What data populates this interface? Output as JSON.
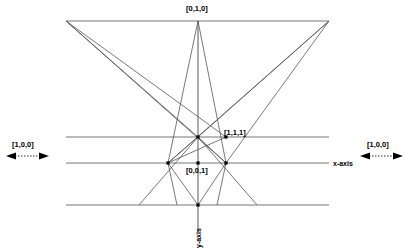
{
  "figure": {
    "background_color": "#ffffff",
    "line_color": "#555555",
    "vertex_color": "#000000",
    "text_color": "#000000",
    "width": 409,
    "height": 252
  },
  "labels": {
    "top_point": "[0,1,0]",
    "mid_right_point": "[1,1,1]",
    "lower_center_point": "[0,0,1]",
    "left_direction": "[1,0,0]",
    "right_direction": "[1,0,0]",
    "x_axis": "x-axis",
    "y_axis": "y-axis"
  },
  "points": [
    {
      "name": "top-left-corner",
      "x": 66,
      "y": 21,
      "label": ""
    },
    {
      "name": "top-right-corner",
      "x": 329,
      "y": 21,
      "label": ""
    },
    {
      "name": "top-apex",
      "x": 198,
      "y": 21,
      "label": "[0,1,0]"
    },
    {
      "name": "center-vertex",
      "x": 198,
      "y": 137,
      "label": ""
    },
    {
      "name": "unit-point",
      "x": 226,
      "y": 137,
      "label": "[1,1,1]"
    },
    {
      "name": "origin-left",
      "x": 168,
      "y": 163,
      "label": ""
    },
    {
      "name": "origin-right",
      "x": 226,
      "y": 163,
      "label": ""
    },
    {
      "name": "origin",
      "x": 198,
      "y": 163,
      "label": "[0,0,1]"
    },
    {
      "name": "bottom-vertex",
      "x": 198,
      "y": 205,
      "label": ""
    }
  ],
  "horizontal_lines": [
    {
      "name": "upper-horizontal",
      "y": 137,
      "x1": 66,
      "x2": 329
    },
    {
      "name": "x-axis-line",
      "y": 163,
      "x1": 66,
      "x2": 329
    },
    {
      "name": "lower-horizontal",
      "y": 205,
      "x1": 66,
      "x2": 329
    }
  ],
  "top_edge": {
    "name": "top-horizontal",
    "y": 21,
    "x1": 66,
    "x2": 329
  },
  "y_axis_line": {
    "name": "y-axis-line",
    "x": 198,
    "y1": 21,
    "y2": 232
  },
  "arrows": {
    "left": {
      "name": "left-double-arrow",
      "x1": 8,
      "x2": 47,
      "y": 156
    },
    "right": {
      "name": "right-double-arrow",
      "x1": 362,
      "x2": 401,
      "y": 156
    }
  }
}
